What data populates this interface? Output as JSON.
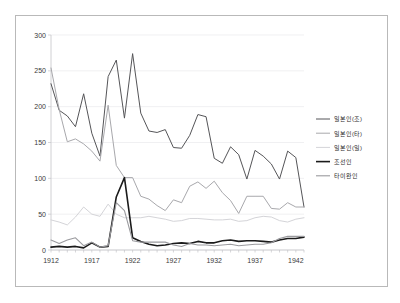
{
  "chart_data": {
    "type": "line",
    "title": "",
    "xlabel": "",
    "ylabel": "",
    "xlim": [
      1912,
      1943
    ],
    "ylim": [
      0,
      300
    ],
    "ytick_labels": [
      "0",
      "50",
      "100",
      "150",
      "200",
      "250",
      "300"
    ],
    "yticks": [
      0,
      50,
      100,
      150,
      200,
      250,
      300
    ],
    "xtick_labels": [
      "1912",
      "1917",
      "1922",
      "1927",
      "1932",
      "1937",
      "1942"
    ],
    "xticks": [
      1912,
      1917,
      1922,
      1927,
      1932,
      1937,
      1942
    ],
    "grid": "horizontal",
    "legend_position": "right",
    "x": [
      1912,
      1913,
      1914,
      1915,
      1916,
      1917,
      1918,
      1919,
      1920,
      1921,
      1922,
      1923,
      1924,
      1925,
      1926,
      1927,
      1928,
      1929,
      1930,
      1931,
      1932,
      1933,
      1934,
      1935,
      1936,
      1937,
      1938,
      1939,
      1940,
      1941,
      1942,
      1943
    ],
    "series": [
      {
        "name": "일본인(조)",
        "color": "#555558",
        "width": 1.0,
        "values": [
          232,
          195,
          187,
          172,
          218,
          163,
          131,
          242,
          265,
          184,
          274,
          191,
          166,
          164,
          168,
          143,
          142,
          160,
          189,
          186,
          128,
          121,
          144,
          133,
          99,
          139,
          131,
          120,
          99,
          138,
          129,
          60
        ]
      },
      {
        "name": "일본인(타)",
        "color": "#a8a8ac",
        "width": 1.0,
        "values": [
          254,
          196,
          151,
          155,
          148,
          138,
          124,
          202,
          118,
          101,
          101,
          75,
          71,
          62,
          55,
          70,
          66,
          89,
          95,
          86,
          96,
          80,
          69,
          51,
          75,
          75,
          75,
          58,
          57,
          66,
          60,
          60
        ]
      },
      {
        "name": "일본인(일)",
        "color": "#d4d4d8",
        "width": 1.0,
        "values": [
          42,
          39,
          35,
          46,
          60,
          50,
          47,
          64,
          50,
          45,
          45,
          45,
          47,
          45,
          43,
          40,
          41,
          44,
          44,
          43,
          42,
          42,
          43,
          40,
          41,
          45,
          47,
          46,
          41,
          39,
          43,
          45
        ]
      },
      {
        "name": "조선인",
        "color": "#1b1b1b",
        "width": 1.6,
        "values": [
          4,
          5,
          4,
          5,
          3,
          10,
          4,
          5,
          74,
          101,
          17,
          12,
          8,
          6,
          7,
          9,
          10,
          9,
          12,
          10,
          10,
          13,
          14,
          12,
          13,
          13,
          12,
          11,
          14,
          16,
          16,
          18
        ]
      },
      {
        "name": "타이완인",
        "color": "#9a9a9e",
        "width": 1.1,
        "values": [
          14,
          9,
          14,
          17,
          6,
          11,
          4,
          6,
          66,
          55,
          13,
          11,
          11,
          11,
          11,
          7,
          5,
          9,
          7,
          7,
          6,
          7,
          8,
          6,
          7,
          8,
          8,
          10,
          16,
          19,
          19,
          19
        ]
      }
    ]
  },
  "legend": {
    "entries": [
      {
        "label": "일본인(조)"
      },
      {
        "label": "일본인(타)"
      },
      {
        "label": "일본인(일)"
      },
      {
        "label": "조선인"
      },
      {
        "label": "타이완인"
      }
    ]
  }
}
